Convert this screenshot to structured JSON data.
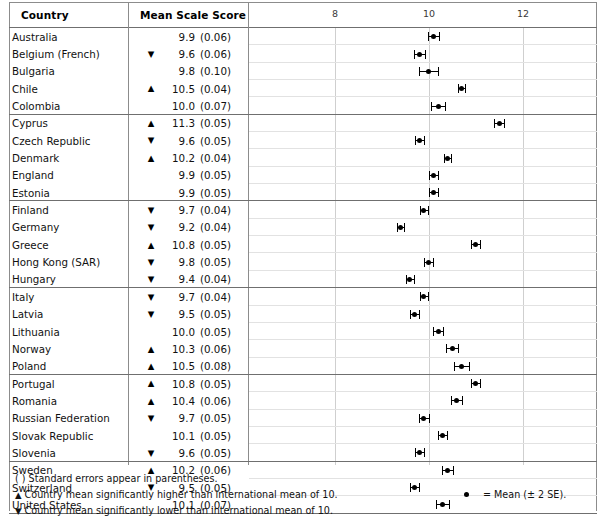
{
  "table": {
    "columns": {
      "country": "Country",
      "score": "Mean Scale Score"
    }
  },
  "axis": {
    "ticks": [
      "8",
      "10",
      "12"
    ],
    "tick_values": [
      8,
      10,
      12
    ],
    "min": 6.9,
    "max": 13.3
  },
  "footnotes": {
    "parentheses": "( ) Standard errors appear in parentheses.",
    "higher_marker": "▲",
    "higher": " Country mean significantly higher than international mean of 10.",
    "lower_marker": "▼",
    "lower": " Country mean significantly lower than international mean of 10.",
    "legend_label": "= Mean (± 2 SE)."
  },
  "chart_data": {
    "type": "scatter",
    "title": "Mean Scale Score",
    "xlabel": "",
    "ylabel": "Country",
    "xlim": [
      6.9,
      13.3
    ],
    "xticks": [
      8,
      10,
      12
    ],
    "grid": true,
    "legend": "= Mean (± 2 SE).",
    "international_mean": 10,
    "error_bar": "± 2 SE",
    "categories": [
      "Australia",
      "Belgium (French)",
      "Bulgaria",
      "Chile",
      "Colombia",
      "Cyprus",
      "Czech Republic",
      "Denmark",
      "England",
      "Estonia",
      "Finland",
      "Germany",
      "Greece",
      "Hong Kong (SAR)",
      "Hungary",
      "Italy",
      "Latvia",
      "Lithuania",
      "Norway",
      "Poland",
      "Portugal",
      "Romania",
      "Russian Federation",
      "Slovak Republic",
      "Slovenia",
      "Sweden",
      "Switzerland",
      "United States"
    ],
    "values": [
      9.9,
      9.6,
      9.8,
      10.5,
      10.0,
      11.3,
      9.6,
      10.2,
      9.9,
      9.9,
      9.7,
      9.2,
      10.8,
      9.8,
      9.4,
      9.7,
      9.5,
      10.0,
      10.3,
      10.5,
      10.8,
      10.4,
      9.7,
      10.1,
      9.6,
      10.2,
      9.5,
      10.1
    ],
    "errors": [
      0.06,
      0.06,
      0.1,
      0.04,
      0.07,
      0.05,
      0.05,
      0.04,
      0.05,
      0.05,
      0.04,
      0.04,
      0.05,
      0.05,
      0.04,
      0.04,
      0.05,
      0.05,
      0.06,
      0.08,
      0.05,
      0.06,
      0.05,
      0.05,
      0.05,
      0.06,
      0.05,
      0.07
    ],
    "significance": [
      "",
      "down",
      "",
      "up",
      "",
      "up",
      "down",
      "up",
      "",
      "",
      "down",
      "down",
      "up",
      "down",
      "down",
      "down",
      "down",
      "",
      "up",
      "up",
      "up",
      "up",
      "down",
      "",
      "down",
      "up",
      "down",
      ""
    ]
  },
  "rows": [
    {
      "country": "Australia",
      "sig": "",
      "mean": "9.9",
      "se": "(0.06)",
      "value": 9.9,
      "error": 0.06,
      "group_end": false
    },
    {
      "country": "Belgium (French)",
      "sig": "▼",
      "mean": "9.6",
      "se": "(0.06)",
      "value": 9.6,
      "error": 0.06,
      "group_end": false
    },
    {
      "country": "Bulgaria",
      "sig": "",
      "mean": "9.8",
      "se": "(0.10)",
      "value": 9.8,
      "error": 0.1,
      "group_end": false
    },
    {
      "country": "Chile",
      "sig": "▲",
      "mean": "10.5",
      "se": "(0.04)",
      "value": 10.5,
      "error": 0.04,
      "group_end": false
    },
    {
      "country": "Colombia",
      "sig": "",
      "mean": "10.0",
      "se": "(0.07)",
      "value": 10.0,
      "error": 0.07,
      "group_end": true
    },
    {
      "country": "Cyprus",
      "sig": "▲",
      "mean": "11.3",
      "se": "(0.05)",
      "value": 11.3,
      "error": 0.05,
      "group_end": false
    },
    {
      "country": "Czech Republic",
      "sig": "▼",
      "mean": "9.6",
      "se": "(0.05)",
      "value": 9.6,
      "error": 0.05,
      "group_end": false
    },
    {
      "country": "Denmark",
      "sig": "▲",
      "mean": "10.2",
      "se": "(0.04)",
      "value": 10.2,
      "error": 0.04,
      "group_end": false
    },
    {
      "country": "England",
      "sig": "",
      "mean": "9.9",
      "se": "(0.05)",
      "value": 9.9,
      "error": 0.05,
      "group_end": false
    },
    {
      "country": "Estonia",
      "sig": "",
      "mean": "9.9",
      "se": "(0.05)",
      "value": 9.9,
      "error": 0.05,
      "group_end": true
    },
    {
      "country": "Finland",
      "sig": "▼",
      "mean": "9.7",
      "se": "(0.04)",
      "value": 9.7,
      "error": 0.04,
      "group_end": false
    },
    {
      "country": "Germany",
      "sig": "▼",
      "mean": "9.2",
      "se": "(0.04)",
      "value": 9.2,
      "error": 0.04,
      "group_end": false
    },
    {
      "country": "Greece",
      "sig": "▲",
      "mean": "10.8",
      "se": "(0.05)",
      "value": 10.8,
      "error": 0.05,
      "group_end": false
    },
    {
      "country": "Hong Kong (SAR)",
      "sig": "▼",
      "mean": "9.8",
      "se": "(0.05)",
      "value": 9.8,
      "error": 0.05,
      "group_end": false
    },
    {
      "country": "Hungary",
      "sig": "▼",
      "mean": "9.4",
      "se": "(0.04)",
      "value": 9.4,
      "error": 0.04,
      "group_end": true
    },
    {
      "country": "Italy",
      "sig": "▼",
      "mean": "9.7",
      "se": "(0.04)",
      "value": 9.7,
      "error": 0.04,
      "group_end": false
    },
    {
      "country": "Latvia",
      "sig": "▼",
      "mean": "9.5",
      "se": "(0.05)",
      "value": 9.5,
      "error": 0.05,
      "group_end": false
    },
    {
      "country": "Lithuania",
      "sig": "",
      "mean": "10.0",
      "se": "(0.05)",
      "value": 10.0,
      "error": 0.05,
      "group_end": false
    },
    {
      "country": "Norway",
      "sig": "▲",
      "mean": "10.3",
      "se": "(0.06)",
      "value": 10.3,
      "error": 0.06,
      "group_end": false
    },
    {
      "country": "Poland",
      "sig": "▲",
      "mean": "10.5",
      "se": "(0.08)",
      "value": 10.5,
      "error": 0.08,
      "group_end": true
    },
    {
      "country": "Portugal",
      "sig": "▲",
      "mean": "10.8",
      "se": "(0.05)",
      "value": 10.8,
      "error": 0.05,
      "group_end": false
    },
    {
      "country": "Romania",
      "sig": "▲",
      "mean": "10.4",
      "se": "(0.06)",
      "value": 10.4,
      "error": 0.06,
      "group_end": false
    },
    {
      "country": "Russian Federation",
      "sig": "▼",
      "mean": "9.7",
      "se": "(0.05)",
      "value": 9.7,
      "error": 0.05,
      "group_end": false
    },
    {
      "country": "Slovak Republic",
      "sig": "",
      "mean": "10.1",
      "se": "(0.05)",
      "value": 10.1,
      "error": 0.05,
      "group_end": false
    },
    {
      "country": "Slovenia",
      "sig": "▼",
      "mean": "9.6",
      "se": "(0.05)",
      "value": 9.6,
      "error": 0.05,
      "group_end": true
    },
    {
      "country": "Sweden",
      "sig": "▲",
      "mean": "10.2",
      "se": "(0.06)",
      "value": 10.2,
      "error": 0.06,
      "group_end": false
    },
    {
      "country": "Switzerland",
      "sig": "▼",
      "mean": "9.5",
      "se": "(0.05)",
      "value": 9.5,
      "error": 0.05,
      "group_end": false
    },
    {
      "country": "United States",
      "sig": "",
      "mean": "10.1",
      "se": "(0.07)",
      "value": 10.1,
      "error": 0.07,
      "group_end": true
    }
  ]
}
